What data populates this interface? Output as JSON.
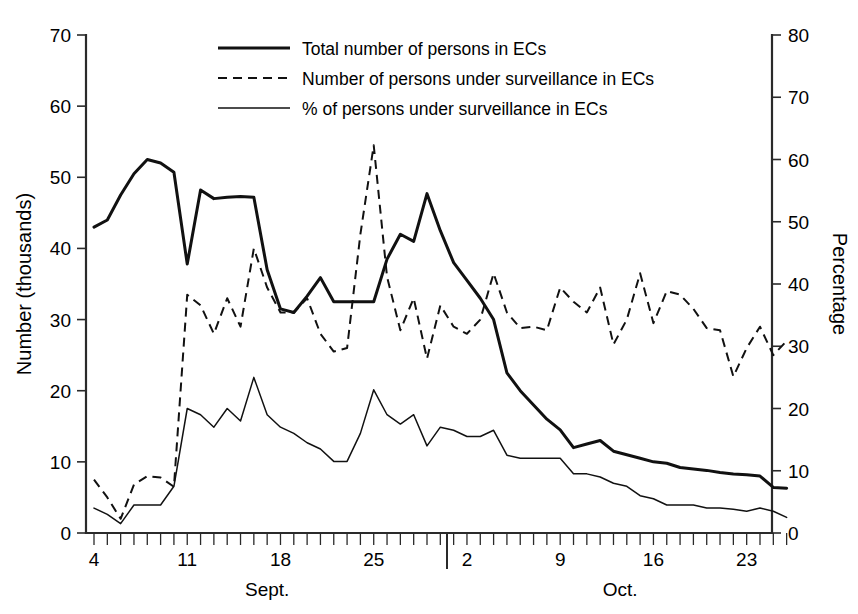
{
  "chart_data": {
    "type": "line",
    "title": "",
    "subtitle": "",
    "xlabel": "",
    "ylabel": "Number (thousands)",
    "y2label": "Percentage",
    "ylim": [
      0,
      70
    ],
    "y2lim": [
      0,
      80
    ],
    "y_ticks": [
      0,
      10,
      20,
      30,
      40,
      50,
      60,
      70
    ],
    "y2_ticks": [
      0,
      10,
      20,
      30,
      40,
      50,
      60,
      70,
      80
    ],
    "grid": false,
    "legend_position": "top-center",
    "x_axis": {
      "tick_labels": [
        "4",
        "11",
        "18",
        "25",
        "2",
        "9",
        "16",
        "23"
      ],
      "tick_label_days": [
        "Sept 4",
        "Sept 11",
        "Sept 18",
        "Sept 25",
        "Oct 2",
        "Oct 9",
        "Oct 16",
        "Oct 23"
      ],
      "month_labels": [
        "Sept.",
        "Oct."
      ],
      "minor_tick_interval_days": 1,
      "range_start": "Sept 4",
      "range_end": "Oct 26",
      "month_separator_after": "Sept 30"
    },
    "legend_entries": [
      {
        "label": "Total number of persons in ECs",
        "style": "solid-thick",
        "axis": "left"
      },
      {
        "label": "Number of persons under surveillance in ECs",
        "style": "dashed",
        "axis": "left"
      },
      {
        "label": "% of persons under surveillance in ECs",
        "style": "solid-thin",
        "axis": "right"
      }
    ],
    "x": [
      "Sept 4",
      "Sept 5",
      "Sept 6",
      "Sept 7",
      "Sept 8",
      "Sept 9",
      "Sept 10",
      "Sept 11",
      "Sept 12",
      "Sept 13",
      "Sept 14",
      "Sept 15",
      "Sept 16",
      "Sept 17",
      "Sept 18",
      "Sept 19",
      "Sept 20",
      "Sept 21",
      "Sept 22",
      "Sept 23",
      "Sept 24",
      "Sept 25",
      "Sept 26",
      "Sept 27",
      "Sept 28",
      "Sept 29",
      "Sept 30",
      "Oct 1",
      "Oct 2",
      "Oct 3",
      "Oct 4",
      "Oct 5",
      "Oct 6",
      "Oct 7",
      "Oct 8",
      "Oct 9",
      "Oct 10",
      "Oct 11",
      "Oct 12",
      "Oct 13",
      "Oct 14",
      "Oct 15",
      "Oct 16",
      "Oct 17",
      "Oct 18",
      "Oct 19",
      "Oct 20",
      "Oct 21",
      "Oct 22",
      "Oct 23",
      "Oct 24",
      "Oct 25",
      "Oct 26"
    ],
    "series": [
      {
        "name": "Total number of persons in ECs",
        "style": "solid-thick",
        "axis": "left",
        "unit": "thousands",
        "values": [
          43.0,
          44.0,
          47.5,
          50.5,
          52.5,
          52.0,
          50.7,
          37.8,
          48.2,
          47.0,
          47.2,
          47.3,
          47.2,
          37.0,
          31.5,
          31.0,
          33.3,
          35.9,
          32.5,
          32.5,
          32.5,
          32.5,
          38.5,
          42.0,
          41.0,
          47.7,
          42.5,
          38.0,
          35.5,
          33.0,
          30.0,
          22.5,
          20.0,
          18.0,
          16.0,
          14.5,
          12.0,
          12.5,
          13.0,
          11.5,
          11.0,
          10.5,
          10.0,
          9.8,
          9.2,
          9.0,
          8.8,
          8.5,
          8.3,
          8.2,
          8.0,
          6.4,
          6.3
        ]
      },
      {
        "name": "Number of persons under surveillance in ECs",
        "style": "dashed",
        "axis": "left",
        "unit": "thousands",
        "values": [
          7.5,
          5.0,
          2.0,
          6.8,
          8.0,
          7.8,
          6.5,
          33.5,
          32.0,
          28.0,
          33.0,
          29.0,
          40.0,
          34.5,
          31.0,
          31.0,
          33.0,
          28.0,
          25.5,
          26.0,
          42.0,
          54.5,
          36.0,
          28.5,
          33.0,
          24.5,
          32.0,
          29.0,
          28.0,
          30.0,
          36.5,
          31.0,
          28.8,
          29.0,
          28.5,
          34.5,
          32.5,
          31.0,
          34.5,
          26.5,
          30.0,
          36.5,
          29.5,
          34.0,
          33.5,
          31.5,
          28.8,
          28.5,
          22.0,
          26.0,
          29.0,
          25.0,
          27.0
        ]
      },
      {
        "name": "% of persons under surveillance in ECs",
        "style": "solid-thin",
        "axis": "right",
        "unit": "percent",
        "values": [
          4.0,
          3.0,
          1.5,
          4.5,
          4.5,
          4.5,
          7.5,
          20.0,
          19.0,
          17.0,
          20.0,
          18.0,
          25.0,
          19.0,
          17.0,
          16.0,
          14.5,
          13.5,
          11.5,
          11.5,
          16.0,
          23.0,
          19.0,
          17.5,
          19.0,
          14.0,
          17.0,
          16.5,
          15.5,
          15.5,
          16.5,
          12.5,
          12.0,
          12.0,
          12.0,
          12.0,
          9.5,
          9.5,
          9.0,
          8.0,
          7.5,
          6.0,
          5.5,
          4.5,
          4.5,
          4.5,
          4.0,
          4.0,
          3.8,
          3.5,
          4.0,
          3.5,
          2.5
        ]
      }
    ]
  }
}
